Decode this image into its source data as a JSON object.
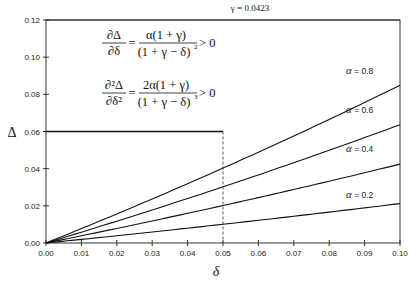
{
  "chart_data": {
    "type": "line",
    "title": "γ = 0.0423",
    "xlabel": "δ",
    "ylabel": "Δ",
    "xlim": [
      0,
      0.1
    ],
    "ylim": [
      0,
      0.12
    ],
    "xticks": [
      "0.00",
      "0.01",
      "0.02",
      "0.03",
      "0.04",
      "0.05",
      "0.06",
      "0.07",
      "0.08",
      "0.09",
      "0.10"
    ],
    "yticks": [
      "0.00",
      "0.02",
      "0.04",
      "0.06",
      "0.08",
      "0.10",
      "0.12"
    ],
    "gamma": 0.0423,
    "function": "Δ = αδ/(1+γ−δ)",
    "x": [
      0,
      0.01,
      0.02,
      0.03,
      0.04,
      0.05,
      0.06,
      0.07,
      0.08,
      0.09,
      0.1
    ],
    "series": [
      {
        "name": "α = 0.8",
        "alpha": 0.8,
        "values": [
          0,
          0.0078,
          0.0156,
          0.0236,
          0.0317,
          0.0399,
          0.0485,
          0.0571,
          0.066,
          0.075,
          0.0849
        ]
      },
      {
        "name": "α = 0.6",
        "alpha": 0.6,
        "values": [
          0,
          0.0058,
          0.0117,
          0.0177,
          0.0238,
          0.03,
          0.0363,
          0.0428,
          0.0495,
          0.0563,
          0.0637
        ]
      },
      {
        "name": "α = 0.4",
        "alpha": 0.4,
        "values": [
          0,
          0.0039,
          0.0078,
          0.0118,
          0.0159,
          0.02,
          0.0242,
          0.0286,
          0.033,
          0.0375,
          0.0424
        ]
      },
      {
        "name": "α = 0.2",
        "alpha": 0.2,
        "values": [
          0,
          0.0019,
          0.0039,
          0.0059,
          0.0079,
          0.01,
          0.0121,
          0.0143,
          0.0165,
          0.0188,
          0.0212
        ]
      }
    ],
    "annotations": {
      "horizontal_line": {
        "y": 0.06,
        "x_from": 0,
        "x_to": 0.05,
        "style": "solid-thick"
      },
      "vertical_line": {
        "x": 0.05,
        "y_from": 0,
        "y_to": 0.06,
        "style": "dashed"
      },
      "formula1": {
        "lhs_num": "∂Δ",
        "lhs_den": "∂δ",
        "rhs_num": "α(1 + γ)",
        "rhs_den": "(1 + γ − δ)",
        "rhs_den_exp": "2",
        "tail": "> 0"
      },
      "formula2": {
        "lhs_num": "∂²Δ",
        "lhs_den": "∂δ²",
        "rhs_num": "2α(1 + γ)",
        "rhs_den": "(1 + γ − δ)",
        "rhs_den_exp": "3",
        "tail": "> 0"
      }
    },
    "grid": false,
    "legend": "inline labels at right end of each line"
  },
  "labels": {
    "title": "γ = 0.0423",
    "xlabel": "δ",
    "ylabel": "Δ",
    "alpha_labels": [
      "α = 0.8",
      "α = 0.6",
      "α = 0.4",
      "α = 0.2"
    ]
  }
}
